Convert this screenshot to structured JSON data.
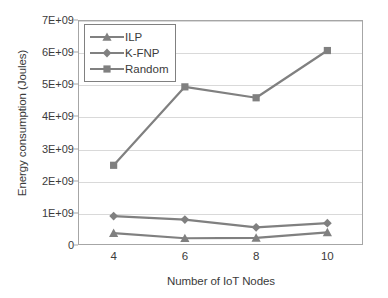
{
  "chart_data": {
    "type": "line",
    "title": "",
    "xlabel": "Number of IoT Nodes",
    "ylabel": "Energy consumption (Joules)",
    "categories": [
      "4",
      "6",
      "8",
      "10"
    ],
    "x": [
      4,
      6,
      8,
      10
    ],
    "ylim": [
      0,
      7000000000
    ],
    "ytick_labels": [
      "0",
      "1E+09",
      "2E+09",
      "3E+09",
      "4E+09",
      "5E+09",
      "6E+09",
      "7E+09"
    ],
    "ytick_values": [
      0,
      1000000000,
      2000000000,
      3000000000,
      4000000000,
      5000000000,
      6000000000,
      7000000000
    ],
    "grid": true,
    "grid_axis": "y",
    "legend_position": "upper-left-inside",
    "series": [
      {
        "name": "ILP",
        "marker": "triangle",
        "color": "#808080",
        "values": [
          370000000,
          210000000,
          220000000,
          390000000
        ]
      },
      {
        "name": "K-FNP",
        "marker": "diamond",
        "color": "#808080",
        "values": [
          900000000,
          790000000,
          550000000,
          680000000
        ]
      },
      {
        "name": "Random",
        "marker": "square",
        "color": "#808080",
        "values": [
          2480000000,
          4920000000,
          4580000000,
          6050000000
        ]
      }
    ]
  },
  "colors": {
    "series": "#808080",
    "gridline": "#d9d9d9",
    "axis": "#a6a6a6",
    "text": "#3b3b3b",
    "background": "#ffffff"
  }
}
